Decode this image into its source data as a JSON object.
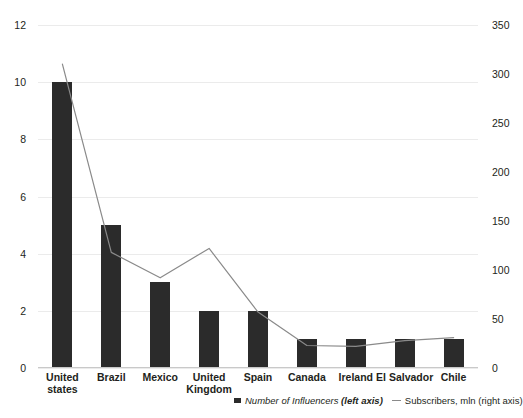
{
  "chart_data": {
    "type": "bar",
    "title": "",
    "subtitle": "",
    "xlabel": "",
    "ylabel": "",
    "y2label": "",
    "grid": true,
    "legend_position": "bottom",
    "categories": [
      "United states",
      "Brazil",
      "Mexico",
      "United\nKingdom",
      "Spain",
      "Canada",
      "Ireland",
      "El Salvador",
      "Chile"
    ],
    "left_axis": {
      "ticks": [
        0,
        2,
        4,
        6,
        8,
        10,
        12
      ],
      "tick_labels": [
        "0",
        "2",
        "4",
        "6",
        "8",
        "10",
        "12"
      ],
      "ylim": [
        0,
        12
      ]
    },
    "right_axis": {
      "ticks": [
        0,
        50,
        100,
        150,
        200,
        250,
        300,
        350
      ],
      "tick_labels": [
        "0",
        "50",
        "100",
        "150",
        "200",
        "250",
        "300",
        "350"
      ],
      "ylim": [
        0,
        350
      ]
    },
    "series": [
      {
        "name": "Number of Influencers (left axis)",
        "type": "bar",
        "axis": "left",
        "color": "#2b2b2b",
        "values": [
          10,
          5,
          3,
          2,
          2,
          1,
          1,
          1,
          1
        ]
      },
      {
        "name": "Subscribers, mln (right axis)",
        "type": "line",
        "axis": "right",
        "color": "#8a8a8a",
        "values": [
          310,
          118,
          92,
          122,
          57,
          23,
          22,
          28,
          31
        ]
      }
    ]
  },
  "legend": {
    "bar_entry_label_italic": "Number of Influencers ",
    "bar_entry_label_bold": "(left axis)",
    "line_entry_label": "Subscribers, mln (right axis)"
  }
}
